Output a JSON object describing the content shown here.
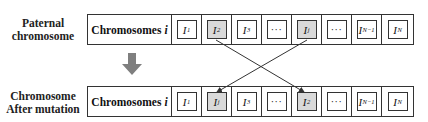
{
  "rows": [
    {
      "label_line1": "Paternal",
      "label_line2": "chromosome",
      "name": "Chromosomes",
      "name_var": "i",
      "genes": [
        {
          "base": "I",
          "sub": "1",
          "highlight": false
        },
        {
          "base": "I",
          "sub": "2",
          "highlight": true
        },
        {
          "base": "I",
          "sub": "3",
          "highlight": false
        },
        {
          "base": "···",
          "sub": "",
          "highlight": false
        },
        {
          "base": "I",
          "sub": "j",
          "highlight": true
        },
        {
          "base": "···",
          "sub": "",
          "highlight": false
        },
        {
          "base": "I",
          "sub": "N−1",
          "highlight": false
        },
        {
          "base": "I",
          "sub": "N",
          "highlight": false
        }
      ]
    },
    {
      "label_line1": "Chromosome",
      "label_line2": "After mutation",
      "name": "Chromosomes",
      "name_var": "i",
      "genes": [
        {
          "base": "I",
          "sub": "1",
          "highlight": false
        },
        {
          "base": "I",
          "sub": "j",
          "highlight": true
        },
        {
          "base": "I",
          "sub": "3",
          "highlight": false
        },
        {
          "base": "···",
          "sub": "",
          "highlight": false
        },
        {
          "base": "I",
          "sub": "2",
          "highlight": true
        },
        {
          "base": "···",
          "sub": "",
          "highlight": false
        },
        {
          "base": "I",
          "sub": "N−1",
          "highlight": false
        },
        {
          "base": "I",
          "sub": "N",
          "highlight": false
        }
      ]
    }
  ],
  "colors": {
    "highlight_fill": "#d9d9d9",
    "arrow_gray": "#7f7f7f",
    "line": "#333333"
  },
  "swap": {
    "from_top": "I_2",
    "to_bottom": "I_2",
    "from_top_2": "I_j",
    "to_bottom_2": "I_j"
  }
}
